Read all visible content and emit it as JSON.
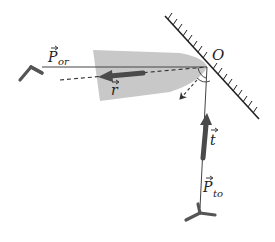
{
  "diagram": {
    "type": "reflection-vector-diagram",
    "labels": {
      "origin": "O",
      "p_or_main": "P",
      "p_or_sub": "or",
      "r": "r",
      "t": "t",
      "p_to_main": "P",
      "p_to_sub": "to"
    },
    "elements": [
      {
        "id": "mirror",
        "description": "hatched reflecting surface through O"
      },
      {
        "id": "P_or",
        "description": "propagation direction toward receiver on the left"
      },
      {
        "id": "r",
        "description": "reflected vector r (thick arrow, pointing left)"
      },
      {
        "id": "t",
        "description": "transmitted/incident vector t (thick arrow, pointing up toward O)"
      },
      {
        "id": "P_to",
        "description": "propagation direction from transmitter below"
      },
      {
        "id": "lobe",
        "description": "grey reflection beam lobe"
      },
      {
        "id": "normal",
        "description": "dashed normal arrow pointing away from mirror"
      }
    ],
    "colors": {
      "line": "#444444",
      "lobe": "#c8c8c8",
      "arrow": "#4a4a4a"
    }
  }
}
